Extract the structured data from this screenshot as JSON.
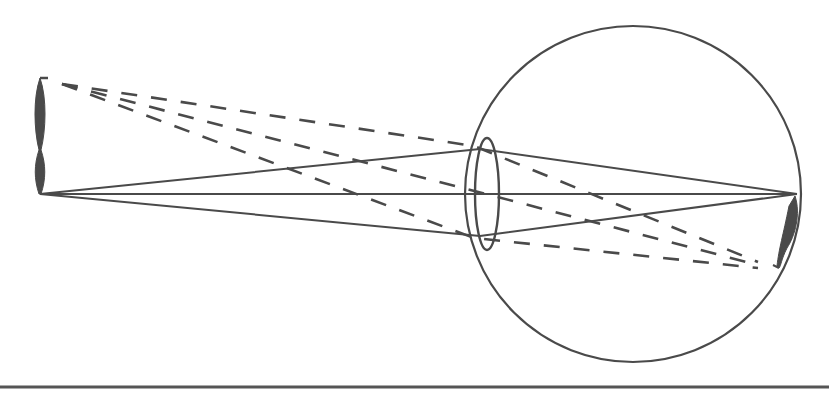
{
  "diagram": {
    "type": "optics",
    "colors": {
      "stroke": "#4a4a4a",
      "fill": "#4a4a4a",
      "background": "#ffffff",
      "rule": "#555555"
    },
    "eyeball": {
      "cx": 633,
      "cy": 194,
      "r": 168
    },
    "lens": {
      "cx": 487,
      "cy": 194,
      "rx": 12,
      "ry": 56
    },
    "object": {
      "x": 40,
      "top": 78,
      "bottom": 194
    },
    "image": {
      "x": 793,
      "top": 196,
      "bottom": 268
    },
    "solid_rays": [
      {
        "from": [
          40,
          194
        ],
        "via": [
          480,
          149
        ],
        "to": [
          797,
          194
        ]
      },
      {
        "from": [
          40,
          194
        ],
        "via": [
          480,
          194
        ],
        "to": [
          797,
          194
        ]
      },
      {
        "from": [
          40,
          194
        ],
        "via": [
          480,
          236
        ],
        "to": [
          797,
          194
        ]
      }
    ],
    "dashed_rays": [
      {
        "from": [
          62,
          84
        ],
        "via": [
          474,
          146
        ],
        "to": [
          758,
          262
        ]
      },
      {
        "from": [
          62,
          84
        ],
        "via": [
          486,
          194
        ],
        "to": [
          758,
          265
        ]
      },
      {
        "from": [
          62,
          84
        ],
        "via": [
          474,
          238
        ],
        "to": [
          758,
          268
        ]
      }
    ],
    "bottom_rule": {
      "y": 387
    }
  }
}
